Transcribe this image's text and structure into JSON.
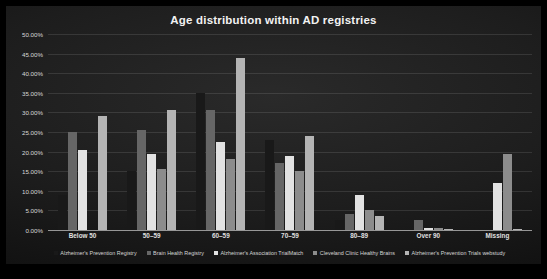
{
  "chart_data": {
    "type": "bar",
    "title": "Age distribution within AD registries",
    "xlabel": "",
    "ylabel": "",
    "ylim": [
      0,
      0.5
    ],
    "grid": true,
    "legend_position": "bottom",
    "y_ticks": [
      "0.00%",
      "5.00%",
      "10.00%",
      "15.00%",
      "20.00%",
      "25.00%",
      "30.00%",
      "35.00%",
      "40.00%",
      "45.00%",
      "50.00%"
    ],
    "y_tick_values": [
      0,
      5,
      10,
      15,
      20,
      25,
      30,
      35,
      40,
      45,
      50
    ],
    "categories": [
      "Below 50",
      "50–59",
      "60–59",
      "70–59",
      "80–89",
      "Over 90",
      "Missing"
    ],
    "series": [
      {
        "name": "Alzheimer's Prevention Registry",
        "color": "#191919",
        "values": [
          9.0,
          15.0,
          35.0,
          23.0,
          2.5,
          0.0,
          0.0
        ]
      },
      {
        "name": "Brain Health Registry",
        "color": "#666666",
        "values": [
          25.0,
          25.5,
          30.5,
          17.0,
          4.0,
          2.5,
          0.0
        ]
      },
      {
        "name": "Alzheimer's Association TrialMatch",
        "color": "#e2e2e2",
        "values": [
          20.5,
          19.5,
          22.5,
          19.0,
          9.0,
          0.6,
          12.0
        ]
      },
      {
        "name": "Cleveland Clinic Healthy Brains",
        "color": "#8c8c8c",
        "values": [
          0.0,
          15.5,
          18.0,
          15.0,
          5.0,
          0.4,
          19.5
        ]
      },
      {
        "name": "Alzheimer's Prevention Trials webstudy",
        "color": "#b4b4b4",
        "values": [
          29.0,
          30.5,
          44.0,
          24.0,
          3.5,
          0.3,
          0.3
        ]
      }
    ],
    "extra_bars": {
      "Below 50": {
        "note": "small light bar at far right of group",
        "value": 1.0,
        "color": "#b4b4b4"
      }
    }
  }
}
